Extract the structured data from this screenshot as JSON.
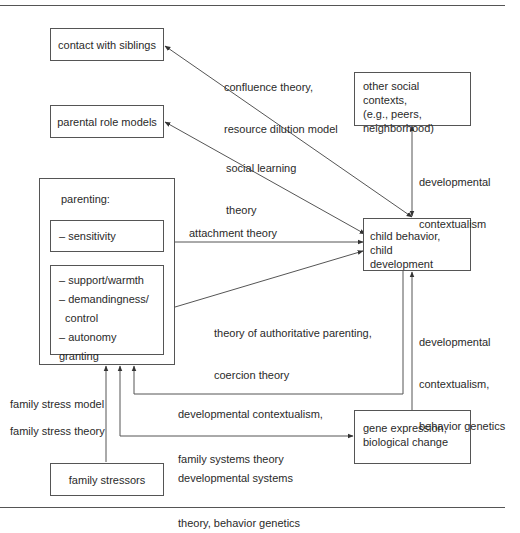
{
  "nodes": {
    "siblings": "contact with siblings",
    "role_models": "parental role models",
    "other_contexts": [
      "other social contexts,",
      "(e.g., peers,",
      "neighborhood)"
    ],
    "parenting_title": "parenting:",
    "sensitivity": "– sensitivity",
    "parenting_items": [
      "– support/warmth",
      "– demandingness/",
      "  control",
      "– autonomy granting"
    ],
    "child": [
      "child behavior, child",
      "development"
    ],
    "gene": [
      "gene expression,",
      "biological change"
    ],
    "stressors": "family stressors"
  },
  "edges": {
    "confluence": [
      "confluence theory,",
      "resource dilution model"
    ],
    "social_learning": [
      "social learning",
      "theory"
    ],
    "dev_context_top": [
      "developmental",
      "contextualism"
    ],
    "attachment": "attachment theory",
    "authoritative": [
      "theory of authoritative parenting,",
      "coercion theory"
    ],
    "dev_context_gene": [
      "developmental",
      "contextualism,",
      "behavior genetics"
    ],
    "family_systems": [
      "developmental contextualism,",
      "family systems theory"
    ],
    "dev_systems": [
      "developmental systems",
      "theory, behavior genetics"
    ],
    "family_stress_model": "family stress model",
    "family_stress_theory": "family stress theory"
  },
  "colors": {
    "line": "#555555",
    "text": "#2a2a2a",
    "background": "#ffffff"
  }
}
